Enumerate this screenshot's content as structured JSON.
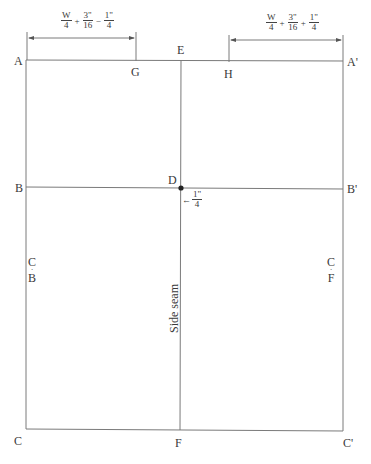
{
  "diagram": {
    "type": "pattern-draft",
    "points": {
      "A": "A",
      "A_prime": "A'",
      "B": "B",
      "B_prime": "B'",
      "C": "C",
      "C_prime": "C'",
      "D": "D",
      "E": "E",
      "F": "F",
      "G": "G",
      "H": "H"
    },
    "dimensions": {
      "left": {
        "term1_num": "W",
        "term1_den": "4",
        "op1": "+",
        "term2_num": "3\"",
        "term2_den": "16",
        "op2": "−",
        "term3_num": "1\"",
        "term3_den": "4"
      },
      "right": {
        "term1_num": "W",
        "term1_den": "4",
        "op1": "+",
        "term2_num": "3\"",
        "term2_den": "16",
        "op2": "+",
        "term3_num": "1\"",
        "term3_den": "4"
      },
      "d_offset": {
        "arrow": "←",
        "num": "1\"",
        "den": "4"
      }
    },
    "grain_marks": {
      "left": {
        "top": "C",
        "dot": "·",
        "bottom": "B"
      },
      "right": {
        "top": "C",
        "dot": "·",
        "bottom": "F"
      }
    },
    "side_seam_label": "Side seam",
    "line_color": "#7a7a7a",
    "text_color": "#3a3a3a"
  }
}
